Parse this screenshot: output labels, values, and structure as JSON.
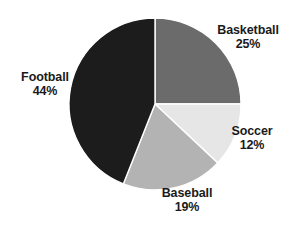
{
  "chart_data": {
    "type": "pie",
    "title": "",
    "subtitle": "",
    "xlabel": "",
    "ylabel": "",
    "legend_position": "none",
    "grid": false,
    "labels_outside": true,
    "start_angle_deg": 0,
    "direction": "clockwise",
    "categories": [
      "Basketball",
      "Soccer",
      "Baseball",
      "Football"
    ],
    "values": [
      25,
      12,
      19,
      44
    ],
    "value_suffix": "%",
    "slices": [
      {
        "name": "Basketball",
        "label": "Basketball",
        "value": 25,
        "value_text": "25%",
        "color": "#6b6b6b",
        "start_deg": 0,
        "end_deg": 90
      },
      {
        "name": "Soccer",
        "label": "Soccer",
        "value": 12,
        "value_text": "12%",
        "color": "#e6e6e6",
        "start_deg": 90,
        "end_deg": 133.2
      },
      {
        "name": "Baseball",
        "label": "Baseball",
        "value": 19,
        "value_text": "19%",
        "color": "#b3b3b3",
        "start_deg": 133.2,
        "end_deg": 201.6
      },
      {
        "name": "Football",
        "label": "Football",
        "value": 44,
        "value_text": "44%",
        "color": "#1c1c1c",
        "start_deg": 201.6,
        "end_deg": 360
      }
    ],
    "background_color": "#ffffff",
    "slice_border_color": "#ffffff",
    "label_text_color": "#1a1a1a"
  }
}
